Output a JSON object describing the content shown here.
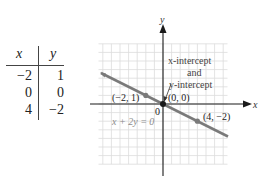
{
  "table": {
    "headers": [
      "x",
      "y"
    ],
    "rows": [
      {
        "x": "−2",
        "y": "1"
      },
      {
        "x": "0",
        "y": "0"
      },
      {
        "x": "4",
        "y": "−2"
      }
    ]
  },
  "graph": {
    "x_axis_label": "x",
    "y_axis_label": "y",
    "origin_label": "0",
    "equation": "x + 2y = 0",
    "annotation": [
      "x-intercept",
      "and",
      "y-intercept"
    ],
    "points": [
      {
        "label": "(−2, 1)",
        "x": -2,
        "y": 1
      },
      {
        "label": "(0, 0)",
        "x": 0,
        "y": 0
      },
      {
        "label": "(4, −2)",
        "x": 4,
        "y": -2
      }
    ],
    "colors": {
      "line": "#7a7a7a",
      "grid": "#d9d9d9",
      "axis": "#1a1a1a",
      "text": "#333333",
      "equation": "#8c8c8c"
    }
  }
}
